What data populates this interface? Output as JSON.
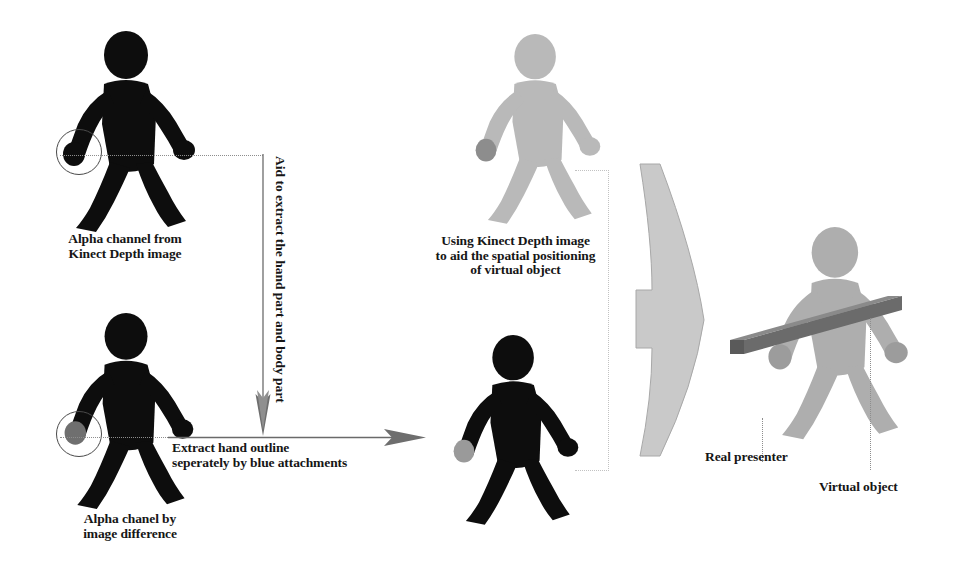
{
  "diagram": {
    "background_color": "#ffffff",
    "captions": {
      "top_left": "Alpha channel from\nKinect Depth image",
      "top_left_line1": "Alpha channel from",
      "top_left_line2": "Kinect Depth image",
      "bottom_left_line1": "Alpha chanel by",
      "bottom_left_line2": "image difference",
      "top_middle_line1": "Using Kinect Depth image",
      "top_middle_line2": "to aid the spatial positioning",
      "top_middle_line3": "of virtual object",
      "middle_arrow_line1": "Extract hand outline",
      "middle_arrow_line2": "seperately by blue attachments",
      "vertical_arrow_label": "Aid to extract the hand part and body part",
      "real_presenter": "Real presenter",
      "virtual_object": "Virtual object"
    },
    "figures": [
      {
        "name": "alpha-channel-depth-figure",
        "fill": "#0d0d0d",
        "position": "top-left",
        "annotation": "hand-highlight-circle"
      },
      {
        "name": "alpha-channel-difference-figure",
        "fill": "#0d0d0d",
        "position": "bottom-left",
        "annotation": "hand-highlight-circle"
      },
      {
        "name": "kinect-depth-gray-figure",
        "fill": "#b9b9b9",
        "position": "top-middle"
      },
      {
        "name": "extracted-silhouette-figure",
        "fill": "#0d0d0d",
        "position": "bottom-middle",
        "hand_fill": "#9a9a9a"
      },
      {
        "name": "composited-presenter-figure",
        "fill": "#aeaeae",
        "position": "right",
        "holds": "virtual-object-bar"
      }
    ],
    "virtual_object_bar": {
      "name": "virtual-object-bar",
      "fill": "#6b6b6b",
      "top_fill": "#8a8a8a",
      "tilt_degrees": -9
    },
    "block_arrow": {
      "name": "composition-block-arrow",
      "fill": "#c9c9c9",
      "stroke": "#9a9a9a",
      "direction": "right"
    },
    "colors": {
      "silhouette_black": "#0d0d0d",
      "gray_light": "#b9b9b9",
      "gray_mid": "#aeaeae",
      "gray_dark": "#6b6b6b",
      "dotted_line": "#8d8d8d",
      "dotted_line_light": "#c2c2c2",
      "arrow": "#555555",
      "text": "#161616"
    }
  }
}
